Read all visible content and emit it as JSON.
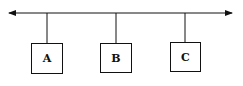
{
  "diagram": {
    "type": "bus-topology",
    "bus": {
      "y": 13,
      "x1": 8,
      "x2": 232,
      "bidirectional": true
    },
    "nodes": [
      {
        "label": "A",
        "x": 31,
        "y": 43,
        "w": 32,
        "h": 31,
        "tap_x": 47
      },
      {
        "label": "B",
        "x": 100,
        "y": 43,
        "w": 32,
        "h": 30,
        "tap_x": 116
      },
      {
        "label": "C",
        "x": 170,
        "y": 42,
        "w": 31,
        "h": 30,
        "tap_x": 185
      }
    ],
    "colors": {
      "stroke": "#111111",
      "background": "#ffffff"
    }
  }
}
